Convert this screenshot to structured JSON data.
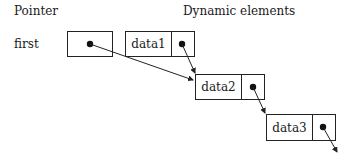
{
  "headings": {
    "pointer": "Pointer",
    "dynamic": "Dynamic elements"
  },
  "pointer": {
    "name": "first"
  },
  "nodes": [
    {
      "data": "data1"
    },
    {
      "data": "data2"
    },
    {
      "data": "data3"
    }
  ],
  "colors": {
    "line": "#222222",
    "background": "#ffffff"
  }
}
